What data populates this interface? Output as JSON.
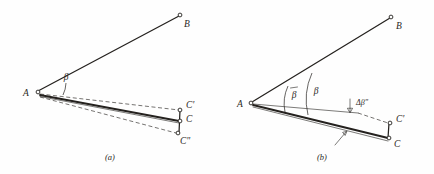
{
  "figure": {
    "background_color": "#fefefe",
    "ink_color": "#24211e",
    "panels": [
      {
        "id": "a",
        "caption": "(a)",
        "points": [
          {
            "name": "A",
            "label": "A",
            "x": 36,
            "y": 92
          },
          {
            "name": "B",
            "label": "B",
            "x": 180,
            "y": 15
          },
          {
            "name": "C-prime",
            "label": "C'",
            "x": 182,
            "y": 110
          },
          {
            "name": "C",
            "label": "C",
            "x": 181,
            "y": 122
          },
          {
            "name": "C-double-prime",
            "label": "C\"",
            "x": 178,
            "y": 134
          }
        ],
        "angles": [
          {
            "name": "beta",
            "label": "β",
            "x": 64,
            "y": 76
          }
        ]
      },
      {
        "id": "b",
        "caption": "(b)",
        "points": [
          {
            "name": "A",
            "label": "A",
            "x": 250,
            "y": 103
          },
          {
            "name": "B",
            "label": "B",
            "x": 391,
            "y": 17
          },
          {
            "name": "C-prime",
            "label": "C'",
            "x": 390,
            "y": 124
          },
          {
            "name": "C",
            "label": "C",
            "x": 389,
            "y": 139
          }
        ],
        "angles": [
          {
            "name": "beta-bar",
            "label": "β",
            "x": 291,
            "y": 94,
            "has_overbar": true
          },
          {
            "name": "beta",
            "label": "β",
            "x": 313,
            "y": 91,
            "has_overbar": false
          }
        ],
        "annotations": [
          {
            "name": "delta-beta-double-prime",
            "label": "Δβ\"",
            "x": 358,
            "y": 106
          }
        ]
      }
    ],
    "legend_symbols": {
      "open_node": "open-circle-node",
      "dashed_line": "dashed-reference-line",
      "solid_line": "solid-measured-line",
      "arc": "angle-arc",
      "arrow": "down-arrow-indicator"
    }
  }
}
